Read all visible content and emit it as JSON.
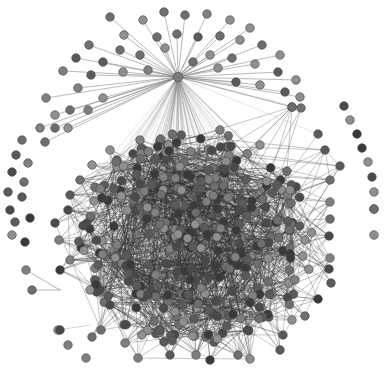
{
  "diagram": {
    "type": "network-graph",
    "layout": "force-directed",
    "colors": {
      "background": "#ffffff",
      "edge_hub": "#8a8a8a",
      "edge_core": "#2e2e2e",
      "node_palette": [
        "#5a5a5a",
        "#6e6e6e",
        "#7f7f7f",
        "#8f8f8f",
        "#4a4a4a",
        "#3a3a3a"
      ],
      "node_stroke": "#444444"
    },
    "hub": {
      "x": 178,
      "y": 77
    },
    "core": {
      "cx": 196,
      "cy": 240,
      "rx": 128,
      "ry": 118
    },
    "hub_ring_nodes": [
      [
        110,
        17
      ],
      [
        143,
        20
      ],
      [
        164,
        12
      ],
      [
        185,
        15
      ],
      [
        207,
        14
      ],
      [
        230,
        20
      ],
      [
        250,
        28
      ],
      [
        124,
        35
      ],
      [
        157,
        37
      ],
      [
        177,
        34
      ],
      [
        198,
        37
      ],
      [
        220,
        36
      ],
      [
        240,
        40
      ],
      [
        262,
        45
      ],
      [
        280,
        55
      ],
      [
        89,
        45
      ],
      [
        120,
        50
      ],
      [
        140,
        55
      ],
      [
        165,
        48
      ],
      [
        210,
        55
      ],
      [
        232,
        58
      ],
      [
        255,
        64
      ],
      [
        278,
        72
      ],
      [
        296,
        80
      ],
      [
        76,
        58
      ],
      [
        103,
        62
      ],
      [
        123,
        72
      ],
      [
        148,
        70
      ],
      [
        193,
        62
      ],
      [
        218,
        68
      ],
      [
        236,
        82
      ],
      [
        260,
        85
      ],
      [
        285,
        92
      ],
      [
        63,
        71
      ],
      [
        91,
        75
      ],
      [
        78,
        88
      ],
      [
        103,
        98
      ],
      [
        70,
        110
      ],
      [
        88,
        110
      ],
      [
        46,
        98
      ],
      [
        55,
        115
      ],
      [
        40,
        128
      ],
      [
        55,
        128
      ],
      [
        45,
        142
      ],
      [
        68,
        128
      ],
      [
        300,
        97
      ],
      [
        292,
        107
      ]
    ],
    "isolated_nodes": [
      [
        22,
        140
      ],
      [
        16,
        155
      ],
      [
        28,
        163
      ],
      [
        12,
        172
      ],
      [
        24,
        182
      ],
      [
        8,
        192
      ],
      [
        22,
        197
      ],
      [
        10,
        210
      ],
      [
        15,
        222
      ],
      [
        30,
        218
      ],
      [
        12,
        235
      ],
      [
        25,
        242
      ],
      [
        344,
        106
      ],
      [
        350,
        120
      ],
      [
        357,
        134
      ],
      [
        362,
        148
      ],
      [
        368,
        162
      ],
      [
        372,
        177
      ],
      [
        374,
        192
      ],
      [
        374,
        209
      ],
      [
        26,
        270
      ],
      [
        32,
        290
      ],
      [
        58,
        330
      ],
      [
        60,
        330
      ],
      [
        68,
        345
      ],
      [
        86,
        358
      ],
      [
        374,
        209
      ],
      [
        374,
        235
      ]
    ],
    "outer_core_nodes": [
      [
        292,
        107
      ],
      [
        301,
        108
      ],
      [
        318,
        134
      ],
      [
        325,
        150
      ],
      [
        340,
        166
      ],
      [
        330,
        180
      ],
      [
        330,
        202
      ],
      [
        330,
        219
      ],
      [
        329,
        236
      ],
      [
        330,
        258
      ],
      [
        329,
        269
      ],
      [
        331,
        283
      ],
      [
        318,
        299
      ],
      [
        305,
        316
      ],
      [
        292,
        320
      ],
      [
        283,
        335
      ],
      [
        280,
        350
      ],
      [
        250,
        359
      ],
      [
        238,
        355
      ],
      [
        210,
        360
      ],
      [
        196,
        355
      ],
      [
        170,
        355
      ],
      [
        138,
        358
      ],
      [
        125,
        343
      ],
      [
        101,
        330
      ],
      [
        92,
        337
      ],
      [
        110,
        305
      ],
      [
        90,
        290
      ],
      [
        70,
        260
      ],
      [
        60,
        270
      ],
      [
        59,
        240
      ],
      [
        55,
        223
      ],
      [
        68,
        210
      ],
      [
        70,
        195
      ],
      [
        80,
        180
      ],
      [
        92,
        165
      ],
      [
        110,
        150
      ],
      [
        140,
        140
      ],
      [
        220,
        130
      ],
      [
        260,
        145
      ],
      [
        290,
        190
      ],
      [
        305,
        240
      ],
      [
        295,
        280
      ]
    ],
    "core_node_count": 330,
    "core_edge_count": 2600,
    "hub_edge_count": 90,
    "node_radius": 4.3
  }
}
